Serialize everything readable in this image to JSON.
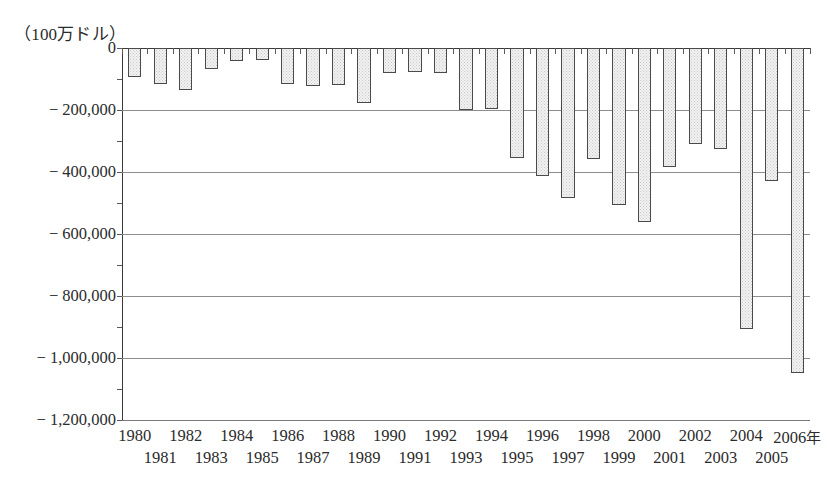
{
  "chart_data": {
    "type": "bar",
    "title": "",
    "subtitle": "",
    "unit_label": "（100万ドル）",
    "xlabel": "",
    "ylabel": "",
    "x_axis_suffix": "年",
    "grid": true,
    "legend": null,
    "ylim": [
      -1200000,
      0
    ],
    "ytick_values": [
      0,
      -200000,
      -400000,
      -600000,
      -800000,
      -1000000,
      -1200000
    ],
    "ytick_labels": [
      "0",
      "− 200,000",
      "− 400,000",
      "− 600,000",
      "− 800,000",
      "− 1,000,000",
      "− 1,200,000"
    ],
    "categories": [
      "1980",
      "1981",
      "1982",
      "1983",
      "1984",
      "1985",
      "1986",
      "1987",
      "1988",
      "1989",
      "1990",
      "1991",
      "1992",
      "1993",
      "1994",
      "1995",
      "1996",
      "1997",
      "1998",
      "1999",
      "2000",
      "2001",
      "2002",
      "2003",
      "2004",
      "2005",
      "2006"
    ],
    "values": [
      -92000,
      -117000,
      -136000,
      -67000,
      -42000,
      -38000,
      -116000,
      -122000,
      -119000,
      -177000,
      -81000,
      -79000,
      -80000,
      -200000,
      -198000,
      -355000,
      -413000,
      -483000,
      -357000,
      -505000,
      -560000,
      -385000,
      -310000,
      -325000,
      -905000,
      -428000,
      -1048000
    ],
    "bar_fill_color": "#f2f2f2",
    "bar_border_color": "#4a4a4a",
    "gridline_color": "#8d8d8d",
    "axis_color": "#3a3a3a",
    "text_color": "#2b2b2b",
    "background_color": "#ffffff"
  }
}
